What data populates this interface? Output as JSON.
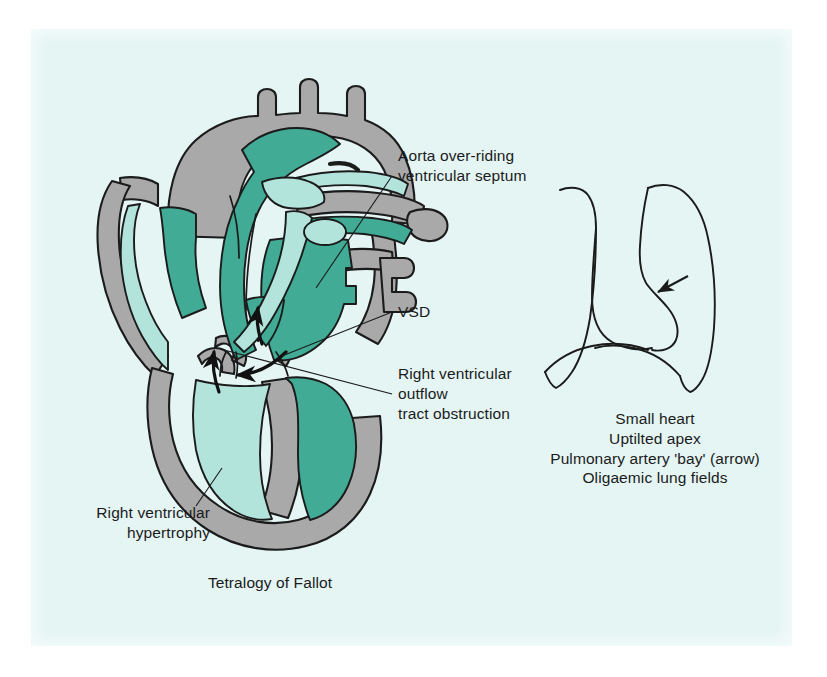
{
  "figure": {
    "title": "Tetralogy of Fallot",
    "background_color": "#e4f5f4",
    "page_color": "#ffffff"
  },
  "heart_diagram": {
    "name": "tetralogy-of-fallot-heart-cross-section",
    "colors": {
      "myocardium_gray": "#a9a9a9",
      "deoxygenated_dark_teal": "#41ab95",
      "oxygenated_light_teal": "#b2e4dc",
      "outline_black": "#1b1b1b"
    },
    "annotations": [
      {
        "id": "aorta",
        "lines": [
          "Aorta over-riding",
          "ventricular septum"
        ],
        "align": "left"
      },
      {
        "id": "vsd",
        "lines": [
          "VSD"
        ],
        "align": "left"
      },
      {
        "id": "rvoto",
        "lines": [
          "Right ventricular",
          "outflow",
          "tract obstruction"
        ],
        "align": "left"
      },
      {
        "id": "rvh",
        "lines": [
          "Right ventricular",
          "hypertrophy"
        ],
        "align": "right"
      }
    ]
  },
  "chest_xray_diagram": {
    "name": "chest-radiograph-outline-boot-shaped-heart",
    "arrow_label": "pulmonary-artery-bay-arrow",
    "findings": [
      "Small heart",
      "Uptilted apex",
      "Pulmonary artery 'bay' (arrow)",
      "Oligaemic lung fields"
    ]
  },
  "captions": {
    "aorta": "Aorta over-riding\nventricular septum",
    "vsd": "VSD",
    "rvoto": "Right ventricular\noutflow\ntract obstruction",
    "rvh": "Right ventricular\nhypertrophy",
    "title": "Tetralogy of Fallot",
    "xray_findings": "Small heart\nUptilted apex\nPulmonary artery 'bay' (arrow)\nOligaemic lung fields"
  }
}
